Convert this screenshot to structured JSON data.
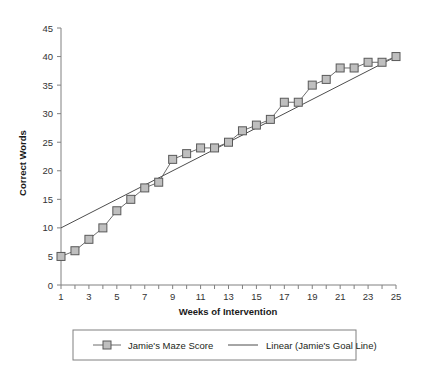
{
  "chart_data": {
    "type": "line",
    "title": "",
    "xlabel": "Weeks of Intervention",
    "ylabel": "Correct Words",
    "x": [
      1,
      2,
      3,
      4,
      5,
      6,
      7,
      8,
      9,
      10,
      11,
      12,
      13,
      14,
      15,
      16,
      17,
      18,
      19,
      20,
      21,
      22,
      23,
      24,
      25
    ],
    "xlim": [
      1,
      25
    ],
    "ylim": [
      0,
      45
    ],
    "y_ticks": [
      0,
      5,
      10,
      15,
      20,
      25,
      30,
      35,
      40,
      45
    ],
    "y_tick_labels": [
      "0",
      "5",
      "10",
      "15",
      "20",
      "25",
      "30",
      "35",
      "40",
      "45"
    ],
    "x_ticks": [
      1,
      2,
      3,
      4,
      5,
      6,
      7,
      8,
      9,
      10,
      11,
      12,
      13,
      14,
      15,
      16,
      17,
      18,
      19,
      20,
      21,
      22,
      23,
      24,
      25
    ],
    "x_tick_labels": [
      "1",
      "",
      "3",
      "",
      "5",
      "",
      "7",
      "",
      "9",
      "",
      "11",
      "",
      "13",
      "",
      "15",
      "",
      "17",
      "",
      "19",
      "",
      "21",
      "",
      "23",
      "",
      "25"
    ],
    "grid": false,
    "legend_position": "bottom",
    "series": [
      {
        "name": "Jamie's Maze Score",
        "marker": "square",
        "marker_fill": "#bfbfbf",
        "marker_stroke": "#595959",
        "line_color": "#6d6d6d",
        "values": [
          5,
          6,
          8,
          10,
          13,
          15,
          17,
          18,
          22,
          23,
          24,
          24,
          25,
          27,
          28,
          29,
          32,
          32,
          35,
          36,
          38,
          38,
          39,
          39,
          40
        ]
      },
      {
        "name": "Linear (Jamie's Goal Line)",
        "marker": "none",
        "line_color": "#4d4d4d",
        "endpoints": [
          {
            "x": 1,
            "y": 10
          },
          {
            "x": 25,
            "y": 40
          }
        ],
        "values": [
          10,
          11.25,
          12.5,
          13.75,
          15,
          16.25,
          17.5,
          18.75,
          20,
          21.25,
          22.5,
          23.75,
          25,
          26.25,
          27.5,
          28.75,
          30,
          31.25,
          32.5,
          33.75,
          35,
          36.25,
          37.5,
          38.75,
          40
        ]
      }
    ]
  },
  "legend": {
    "items": [
      {
        "label": "Jamie's Maze Score",
        "type": "line-marker"
      },
      {
        "label": "Linear (Jamie's Goal Line)",
        "type": "line"
      }
    ]
  },
  "colors": {
    "marker_fill": "#bfbfbf",
    "marker_stroke": "#595959",
    "series_line": "#6d6d6d",
    "trend_line": "#4d4d4d",
    "axis": "#808080",
    "text": "#231f20",
    "background": "#ffffff"
  }
}
